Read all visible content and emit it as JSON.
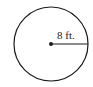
{
  "diagram": {
    "shape": "circle",
    "radius_label": "8 ft.",
    "colors": {
      "stroke": "#1a1a1a",
      "background": "#ffffff"
    }
  }
}
